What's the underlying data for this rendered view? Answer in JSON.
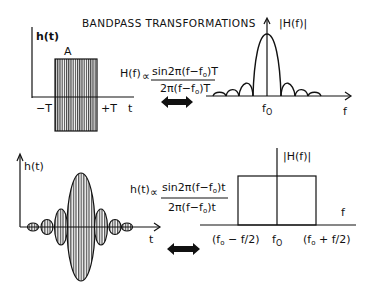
{
  "title": "BANDPASS TRANSFORMATIONS",
  "colors": {
    "ink": "#111111",
    "background": "#ffffff",
    "hatch": "#222222"
  },
  "top_left": {
    "y_axis_label": "h(t)",
    "amplitude_label": "A",
    "x_tick_left": "−T",
    "x_tick_right": "+T",
    "x_axis_label": "t"
  },
  "top_formula": {
    "lhs": "H(f)",
    "proportional": "∝",
    "numerator": "sin2π(f−f",
    "numerator_sub": "o",
    "numerator_tail": ")T",
    "denominator": "2π(f−f",
    "denominator_sub": "o",
    "denominator_tail": ")T"
  },
  "top_right": {
    "y_axis_label": "|H(f)|",
    "center_label": "f",
    "center_sub": "O",
    "x_axis_label": "f"
  },
  "bottom_left": {
    "y_axis_label": "h(t)",
    "x_axis_label": "t"
  },
  "bottom_formula": {
    "lhs": "h(t)",
    "proportional": "∝",
    "numerator": "sin2π(f−f",
    "numerator_sub": "o",
    "numerator_tail": ")t",
    "denominator": "2π(f−f",
    "denominator_sub": "o",
    "denominator_tail": ")t"
  },
  "bottom_right": {
    "y_axis_label": "|H(f)|",
    "x_axis_label": "f",
    "left_edge_label": "(f",
    "left_edge_sub": "o",
    "left_edge_tail": " − f/2)",
    "center_label": "f",
    "center_sub": "O",
    "right_edge_label": "(f",
    "right_edge_sub": "o",
    "right_edge_tail": " + f/2)"
  },
  "arrows": {
    "top": "double-arrow-icon",
    "bottom": "double-arrow-icon"
  }
}
